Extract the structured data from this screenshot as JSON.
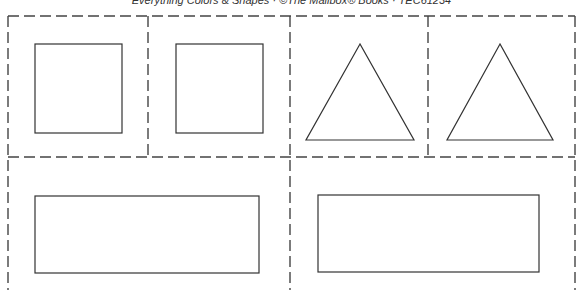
{
  "header": {
    "text": "Everything Colors & Shapes · ©The Mailbox® Books · TEC61234"
  },
  "cards": [
    {
      "shape": "square"
    },
    {
      "shape": "square"
    },
    {
      "shape": "triangle"
    },
    {
      "shape": "triangle"
    },
    {
      "shape": "rectangle"
    },
    {
      "shape": "rectangle"
    }
  ],
  "colors": {
    "line": "#333333",
    "dash": "#444444"
  }
}
